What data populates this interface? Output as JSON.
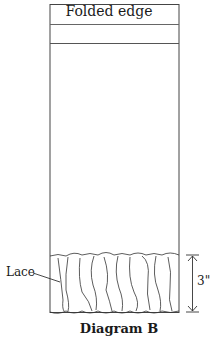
{
  "diagram": {
    "top_label": "Folded edge",
    "lace_label": "Lace",
    "dimension_label": "3\"",
    "caption": "Diagram B"
  }
}
